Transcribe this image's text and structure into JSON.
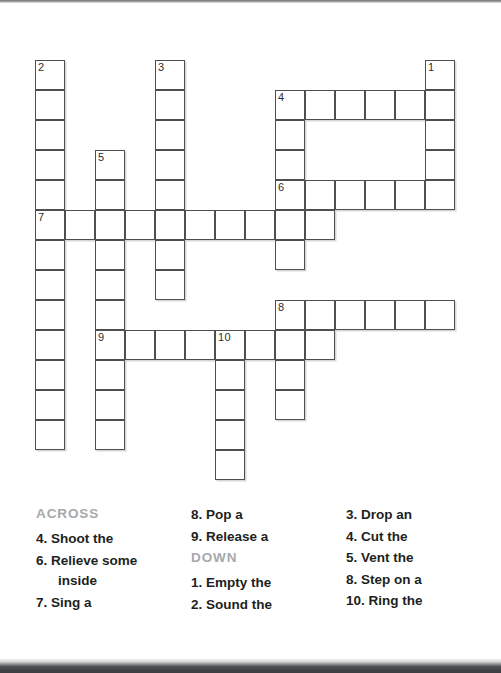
{
  "puzzle": {
    "grid": {
      "cell_size": 30,
      "origin_x": 35,
      "origin_y": 60,
      "entries": [
        {
          "number": "1",
          "direction": "down",
          "row": 0,
          "col": 13,
          "length": 4
        },
        {
          "number": "2",
          "direction": "down",
          "row": 0,
          "col": 0,
          "length": 13
        },
        {
          "number": "3",
          "direction": "down",
          "row": 0,
          "col": 4,
          "length": 8
        },
        {
          "number": "4",
          "direction": "across",
          "row": 1,
          "col": 8,
          "length": 6
        },
        {
          "number": "4",
          "direction": "down",
          "row": 1,
          "col": 8,
          "length": 6
        },
        {
          "number": "5",
          "direction": "down",
          "row": 3,
          "col": 2,
          "length": 10
        },
        {
          "number": "6",
          "direction": "across",
          "row": 4,
          "col": 8,
          "length": 6
        },
        {
          "number": "7",
          "direction": "across",
          "row": 5,
          "col": 0,
          "length": 10
        },
        {
          "number": "8",
          "direction": "across",
          "row": 8,
          "col": 8,
          "length": 6
        },
        {
          "number": "8",
          "direction": "down",
          "row": 8,
          "col": 8,
          "length": 4
        },
        {
          "number": "9",
          "direction": "across",
          "row": 9,
          "col": 2,
          "length": 8
        },
        {
          "number": "10",
          "direction": "down",
          "row": 9,
          "col": 6,
          "length": 5
        }
      ]
    },
    "clues": {
      "across_heading": "ACROSS",
      "down_heading": "DOWN",
      "across": [
        {
          "number": "4.",
          "text": "Shoot the"
        },
        {
          "number": "6.",
          "text": "Relieve some",
          "continuation": "inside"
        },
        {
          "number": "7.",
          "text": "Sing a"
        },
        {
          "number": "8.",
          "text": "Pop a"
        },
        {
          "number": "9.",
          "text": "Release a"
        }
      ],
      "down": [
        {
          "number": "1.",
          "text": "Empty the"
        },
        {
          "number": "2.",
          "text": "Sound the"
        },
        {
          "number": "3.",
          "text": "Drop an"
        },
        {
          "number": "4.",
          "text": "Cut the"
        },
        {
          "number": "5.",
          "text": "Vent the"
        },
        {
          "number": "8.",
          "text": "Step on a"
        },
        {
          "number": "10.",
          "text": "Ring the"
        }
      ]
    },
    "colors": {
      "cell_border": "#4d4f51",
      "cell_fill": "#ffffff",
      "clue_text": "#1d1f21",
      "heading_text": "#a7a9ab",
      "page_background": "#ffffff"
    }
  }
}
